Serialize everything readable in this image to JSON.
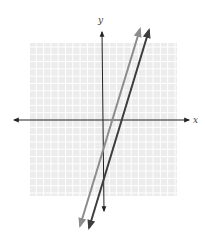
{
  "chart_data": {
    "type": "line",
    "title": "",
    "xlabel": "x",
    "ylabel": "y",
    "xlim": [
      -10,
      10
    ],
    "ylim": [
      -10,
      10
    ],
    "grid": true,
    "tick_labels": false,
    "series": [
      {
        "name": "line-1",
        "equation": "y = 3x - 4",
        "slope": 3,
        "intercept": -4,
        "color": "#8c8c8c",
        "points": [
          [
            -1.8,
            -9.4
          ],
          [
            5.3,
            11.9
          ]
        ]
      },
      {
        "name": "line-2",
        "equation": "y = 3x - 8",
        "slope": 3,
        "intercept": -8,
        "color": "#3d3d3d",
        "points": [
          [
            -0.5,
            -9.5
          ],
          [
            6.6,
            11.8
          ]
        ]
      }
    ]
  },
  "axes": {
    "x_label": "x",
    "y_label": "y"
  },
  "colors": {
    "grid_background": "#ececec",
    "grid_line": "#ffffff",
    "axis": "#222222",
    "line_light": "#8c8c8c",
    "line_dark": "#3d3d3d"
  }
}
